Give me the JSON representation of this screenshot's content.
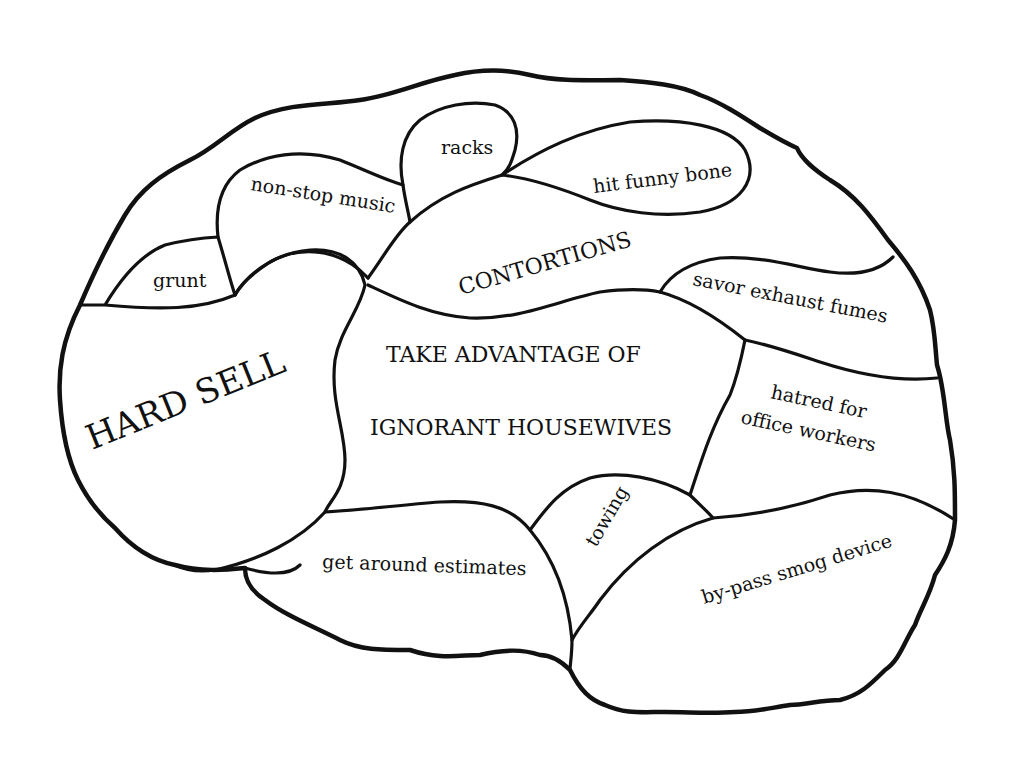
{
  "diagram": {
    "type": "brain-map",
    "stroke_color": "#111111",
    "background_color": "#ffffff",
    "regions": [
      {
        "id": "grunt",
        "label": "grunt"
      },
      {
        "id": "non-stop-music",
        "label": "non-stop music"
      },
      {
        "id": "racks",
        "label": "racks"
      },
      {
        "id": "hit-funny-bone",
        "label": "hit funny bone"
      },
      {
        "id": "contortions",
        "label": "CONTORTIONS"
      },
      {
        "id": "savor-exhaust-fumes",
        "label": "savor exhaust fumes"
      },
      {
        "id": "hard-sell",
        "label": "HARD SELL"
      },
      {
        "id": "take-advantage",
        "label_line1": "TAKE ADVANTAGE OF",
        "label_line2": "IGNORANT HOUSEWIVES"
      },
      {
        "id": "hatred-office-workers",
        "label_line1": "hatred for",
        "label_line2": "office workers"
      },
      {
        "id": "towing",
        "label": "towing"
      },
      {
        "id": "get-around-estimates",
        "label": "get around estimates"
      },
      {
        "id": "by-pass-smog-device",
        "label": "by-pass smog device"
      }
    ]
  }
}
